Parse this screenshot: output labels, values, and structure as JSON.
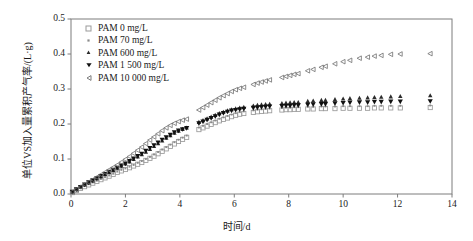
{
  "chart_data": {
    "type": "scatter",
    "title": "",
    "xlabel": "时间/d",
    "ylabel": "单位VS加入量累积产气率/(L·g)",
    "xlim": [
      0,
      14
    ],
    "ylim": [
      0,
      0.5
    ],
    "xticks": [
      0,
      2,
      4,
      6,
      8,
      10,
      12,
      14
    ],
    "xtick_labels": [
      "0",
      "2",
      "4",
      "6",
      "8",
      "10",
      "12",
      "14"
    ],
    "yticks": [
      0.0,
      0.1,
      0.2,
      0.3,
      0.4,
      0.5
    ],
    "ytick_labels": [
      "0.0",
      "0.1",
      "0.2",
      "0.3",
      "0.4",
      "0.5"
    ],
    "grid": false,
    "legend_position": "upper-left",
    "frame": "box",
    "series": [
      {
        "name": "PAM 0 mg/L",
        "marker": "open-square",
        "color": "#9a9a9a",
        "x": [
          0.05,
          0.2,
          0.35,
          0.5,
          0.65,
          0.8,
          0.95,
          1.1,
          1.25,
          1.4,
          1.55,
          1.7,
          1.85,
          2.0,
          2.15,
          2.3,
          2.45,
          2.6,
          2.75,
          2.9,
          3.05,
          3.2,
          3.35,
          3.5,
          3.65,
          3.8,
          3.95,
          4.1,
          4.25,
          4.7,
          4.85,
          5.0,
          5.15,
          5.3,
          5.45,
          5.6,
          5.75,
          5.9,
          6.05,
          6.2,
          6.35,
          6.7,
          6.85,
          7.0,
          7.15,
          7.3,
          7.75,
          7.9,
          8.05,
          8.2,
          8.35,
          8.7,
          8.9,
          9.2,
          9.35,
          9.7,
          10.0,
          10.25,
          10.6,
          10.9,
          11.15,
          11.4,
          11.75,
          12.1,
          13.2
        ],
        "y": [
          0.004,
          0.01,
          0.016,
          0.021,
          0.026,
          0.031,
          0.036,
          0.041,
          0.046,
          0.051,
          0.056,
          0.062,
          0.066,
          0.07,
          0.075,
          0.08,
          0.085,
          0.09,
          0.096,
          0.102,
          0.108,
          0.115,
          0.122,
          0.129,
          0.136,
          0.143,
          0.15,
          0.156,
          0.162,
          0.184,
          0.189,
          0.194,
          0.199,
          0.204,
          0.209,
          0.213,
          0.217,
          0.221,
          0.225,
          0.228,
          0.23,
          0.233,
          0.235,
          0.236,
          0.237,
          0.238,
          0.24,
          0.241,
          0.241,
          0.242,
          0.242,
          0.243,
          0.243,
          0.244,
          0.244,
          0.244,
          0.245,
          0.245,
          0.245,
          0.245,
          0.246,
          0.246,
          0.246,
          0.246,
          0.247
        ]
      },
      {
        "name": "PAM 70 mg/L",
        "marker": "dot",
        "color": "#8a8a8a",
        "x": [
          0.05,
          0.2,
          0.35,
          0.5,
          0.65,
          0.8,
          0.95,
          1.1,
          1.25,
          1.4,
          1.55,
          1.7,
          1.85,
          2.0,
          2.15,
          2.3,
          2.45,
          2.6,
          2.75,
          2.9,
          3.05,
          3.2,
          3.35,
          3.5,
          3.65,
          3.8,
          3.95,
          4.1,
          4.25,
          4.7,
          4.85,
          5.0,
          5.15,
          5.3,
          5.45,
          5.6,
          5.75,
          5.9,
          6.05,
          6.2,
          6.35,
          6.7,
          6.85,
          7.0,
          7.15,
          7.3,
          7.75,
          7.9,
          8.05,
          8.2,
          8.35,
          8.7,
          8.9,
          9.2,
          9.35,
          9.7,
          10.0,
          10.25,
          10.6,
          10.9,
          11.15,
          11.4,
          11.75,
          12.1,
          13.2
        ],
        "y": [
          0.005,
          0.011,
          0.017,
          0.023,
          0.028,
          0.033,
          0.038,
          0.043,
          0.048,
          0.053,
          0.058,
          0.064,
          0.069,
          0.073,
          0.078,
          0.083,
          0.089,
          0.094,
          0.1,
          0.106,
          0.113,
          0.12,
          0.127,
          0.134,
          0.141,
          0.148,
          0.155,
          0.161,
          0.167,
          0.19,
          0.195,
          0.2,
          0.205,
          0.21,
          0.215,
          0.219,
          0.223,
          0.227,
          0.231,
          0.234,
          0.236,
          0.239,
          0.241,
          0.242,
          0.243,
          0.244,
          0.246,
          0.247,
          0.247,
          0.248,
          0.248,
          0.249,
          0.249,
          0.25,
          0.25,
          0.25,
          0.251,
          0.251,
          0.251,
          0.251,
          0.252,
          0.252,
          0.252,
          0.252,
          0.253
        ]
      },
      {
        "name": "PAM 600 mg/L",
        "marker": "filled-triangle-up",
        "color": "#2b2b2b",
        "x": [
          0.05,
          0.2,
          0.35,
          0.5,
          0.65,
          0.8,
          0.95,
          1.1,
          1.25,
          1.4,
          1.55,
          1.7,
          1.85,
          2.0,
          2.15,
          2.3,
          2.45,
          2.6,
          2.75,
          2.9,
          3.05,
          3.2,
          3.35,
          3.5,
          3.65,
          3.8,
          3.95,
          4.1,
          4.25,
          4.7,
          4.85,
          5.0,
          5.15,
          5.3,
          5.45,
          5.6,
          5.75,
          5.9,
          6.05,
          6.2,
          6.35,
          6.7,
          6.85,
          7.0,
          7.15,
          7.3,
          7.75,
          7.9,
          8.05,
          8.2,
          8.35,
          8.7,
          8.9,
          9.2,
          9.35,
          9.7,
          10.0,
          10.25,
          10.6,
          10.9,
          11.15,
          11.4,
          11.75,
          12.1,
          13.2
        ],
        "y": [
          0.006,
          0.013,
          0.02,
          0.026,
          0.032,
          0.038,
          0.044,
          0.05,
          0.056,
          0.062,
          0.068,
          0.074,
          0.08,
          0.086,
          0.092,
          0.099,
          0.106,
          0.113,
          0.12,
          0.128,
          0.136,
          0.144,
          0.152,
          0.16,
          0.167,
          0.174,
          0.18,
          0.185,
          0.189,
          0.205,
          0.21,
          0.215,
          0.22,
          0.225,
          0.23,
          0.234,
          0.238,
          0.241,
          0.244,
          0.246,
          0.248,
          0.252,
          0.254,
          0.255,
          0.256,
          0.257,
          0.259,
          0.26,
          0.261,
          0.262,
          0.262,
          0.265,
          0.266,
          0.268,
          0.268,
          0.27,
          0.272,
          0.273,
          0.274,
          0.275,
          0.276,
          0.277,
          0.278,
          0.279,
          0.281
        ]
      },
      {
        "name": "PAM 1 500 mg/L",
        "marker": "filled-triangle-down",
        "color": "#111111",
        "x": [
          0.05,
          0.2,
          0.35,
          0.5,
          0.65,
          0.8,
          0.95,
          1.1,
          1.25,
          1.4,
          1.55,
          1.7,
          1.85,
          2.0,
          2.15,
          2.3,
          2.45,
          2.6,
          2.75,
          2.9,
          3.05,
          3.2,
          3.35,
          3.5,
          3.65,
          3.8,
          3.95,
          4.1,
          4.25,
          4.7,
          4.85,
          5.0,
          5.15,
          5.3,
          5.45,
          5.6,
          5.75,
          5.9,
          6.05,
          6.2,
          6.35,
          6.7,
          6.85,
          7.0,
          7.15,
          7.3,
          7.75,
          7.9,
          8.05,
          8.2,
          8.35,
          8.7,
          8.9,
          9.2,
          9.35,
          9.7,
          10.0,
          10.25,
          10.6,
          10.9,
          11.15,
          11.4,
          11.75,
          12.1,
          13.2
        ],
        "y": [
          0.006,
          0.013,
          0.02,
          0.027,
          0.033,
          0.039,
          0.045,
          0.051,
          0.057,
          0.063,
          0.069,
          0.075,
          0.081,
          0.087,
          0.094,
          0.101,
          0.108,
          0.115,
          0.123,
          0.131,
          0.139,
          0.147,
          0.155,
          0.162,
          0.169,
          0.176,
          0.181,
          0.185,
          0.188,
          0.202,
          0.207,
          0.212,
          0.217,
          0.222,
          0.227,
          0.231,
          0.235,
          0.238,
          0.24,
          0.242,
          0.243,
          0.246,
          0.247,
          0.248,
          0.249,
          0.25,
          0.251,
          0.252,
          0.252,
          0.253,
          0.253,
          0.255,
          0.256,
          0.257,
          0.257,
          0.259,
          0.26,
          0.261,
          0.262,
          0.262,
          0.263,
          0.263,
          0.264,
          0.264,
          0.265
        ]
      },
      {
        "name": "PAM 10 000 mg/L",
        "marker": "open-triangle-left",
        "color": "#6e6e6e",
        "x": [
          0.05,
          0.2,
          0.35,
          0.5,
          0.65,
          0.8,
          0.95,
          1.1,
          1.25,
          1.4,
          1.55,
          1.7,
          1.85,
          2.0,
          2.15,
          2.3,
          2.45,
          2.6,
          2.75,
          2.9,
          3.05,
          3.2,
          3.35,
          3.5,
          3.65,
          3.8,
          3.95,
          4.1,
          4.25,
          4.7,
          4.85,
          5.0,
          5.15,
          5.3,
          5.45,
          5.6,
          5.75,
          5.9,
          6.05,
          6.2,
          6.35,
          6.7,
          6.85,
          7.0,
          7.15,
          7.3,
          7.75,
          7.9,
          8.05,
          8.2,
          8.35,
          8.7,
          8.9,
          9.2,
          9.35,
          9.7,
          10.0,
          10.25,
          10.6,
          10.9,
          11.15,
          11.4,
          11.75,
          12.1,
          13.2
        ],
        "y": [
          0.006,
          0.013,
          0.02,
          0.027,
          0.034,
          0.041,
          0.048,
          0.055,
          0.062,
          0.069,
          0.076,
          0.083,
          0.091,
          0.099,
          0.107,
          0.116,
          0.125,
          0.134,
          0.144,
          0.154,
          0.163,
          0.172,
          0.181,
          0.189,
          0.196,
          0.202,
          0.207,
          0.211,
          0.214,
          0.24,
          0.247,
          0.254,
          0.261,
          0.268,
          0.275,
          0.281,
          0.287,
          0.293,
          0.298,
          0.302,
          0.305,
          0.313,
          0.317,
          0.32,
          0.323,
          0.326,
          0.333,
          0.336,
          0.339,
          0.342,
          0.344,
          0.352,
          0.356,
          0.362,
          0.365,
          0.372,
          0.378,
          0.382,
          0.388,
          0.391,
          0.394,
          0.396,
          0.399,
          0.4,
          0.401
        ]
      }
    ]
  },
  "legend": {
    "items": [
      {
        "label": "PAM 0 mg/L"
      },
      {
        "label": "PAM 70 mg/L"
      },
      {
        "label": "PAM 600 mg/L"
      },
      {
        "label": "PAM 1 500 mg/L"
      },
      {
        "label": "PAM 10 000 mg/L"
      }
    ]
  },
  "axes": {
    "x_title": "时间/d",
    "y_title": "单位VS加入量累积产气率/(L·g)"
  },
  "colors": {
    "axis": "#7d7d7d",
    "text": "#1a1a1a",
    "background": "#ffffff"
  }
}
